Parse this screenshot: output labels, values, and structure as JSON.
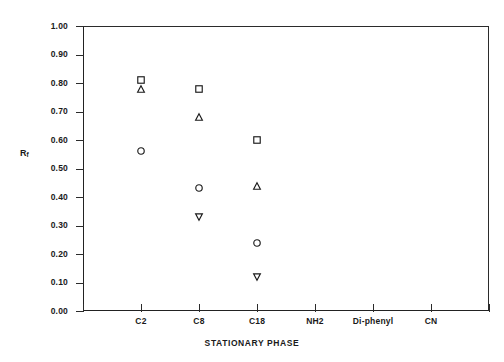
{
  "chart_data": {
    "type": "scatter",
    "title": "",
    "xlabel": "STATIONARY PHASE",
    "ylabel": "Rf",
    "ylabel_base": "R",
    "ylabel_sub": "f",
    "categories": [
      "C2",
      "C8",
      "C18",
      "NH2",
      "Di-phenyl",
      "CN"
    ],
    "ylim": [
      0.0,
      1.0
    ],
    "ytick_labels": [
      "1.00",
      "0.90",
      "0.80",
      "0.70",
      "0.60",
      "0.50",
      "0.40",
      "0.30",
      "0.20",
      "0.10",
      "0.00"
    ],
    "ytick_values": [
      1.0,
      0.9,
      0.8,
      0.7,
      0.6,
      0.5,
      0.4,
      0.3,
      0.2,
      0.1,
      0.0
    ],
    "grid": false,
    "legend": "none",
    "frame": "box",
    "series": [
      {
        "name": "square",
        "marker": "square",
        "points": [
          {
            "category": "C2",
            "value": 0.81
          },
          {
            "category": "C8",
            "value": 0.78
          },
          {
            "category": "C18",
            "value": 0.6
          }
        ]
      },
      {
        "name": "triangle-up",
        "marker": "triangle-up",
        "points": [
          {
            "category": "C2",
            "value": 0.78
          },
          {
            "category": "C8",
            "value": 0.68
          },
          {
            "category": "C18",
            "value": 0.44
          }
        ]
      },
      {
        "name": "circle",
        "marker": "circle",
        "points": [
          {
            "category": "C2",
            "value": 0.56
          },
          {
            "category": "C8",
            "value": 0.43
          },
          {
            "category": "C18",
            "value": 0.24
          }
        ]
      },
      {
        "name": "triangle-down",
        "marker": "triangle-down",
        "points": [
          {
            "category": "C8",
            "value": 0.33
          },
          {
            "category": "C18",
            "value": 0.12
          }
        ]
      }
    ],
    "empty_categories": [
      "NH2",
      "Di-phenyl",
      "CN"
    ],
    "colors": {
      "axis": "#2b2b2b",
      "marker": "#1a1a1a",
      "background": "#ffffff"
    }
  },
  "artifact": {
    "text": "fragment of text from the page below the figure"
  }
}
